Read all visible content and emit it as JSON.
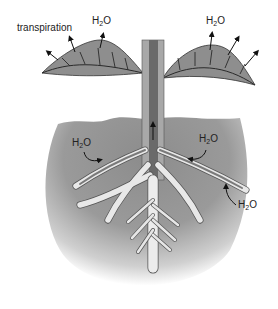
{
  "diagram": {
    "labels": {
      "transpiration": "transpiration",
      "water_prefix": "H",
      "water_subscript": "2",
      "water_suffix": "O"
    },
    "water_labels": [
      {
        "id": "leaf-left",
        "position": "above left leaf"
      },
      {
        "id": "leaf-right",
        "position": "above right leaf"
      },
      {
        "id": "root-left",
        "position": "left root in soil"
      },
      {
        "id": "root-right",
        "position": "right root in soil"
      },
      {
        "id": "root-far-right",
        "position": "tip of far right root"
      }
    ],
    "colors": {
      "leaf": "#8e8e8e",
      "leaf_vein": "#2a2a2a",
      "stem_outer": "#a8a8a8",
      "stem_inner": "#6a6a6a",
      "soil": "#8a8a8a",
      "root_outer": "#e8e8e8",
      "root_inner": "#7a7a7a",
      "arrow": "#111111"
    }
  }
}
